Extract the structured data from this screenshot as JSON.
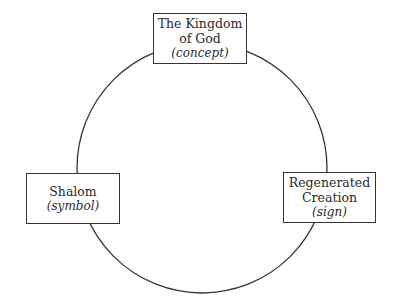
{
  "diagram": {
    "type": "cycle",
    "nodes": [
      {
        "id": "top",
        "title": "The Kingdom of God",
        "title_lines": [
          "The Kingdom",
          "of God"
        ],
        "qualifier": "(concept)"
      },
      {
        "id": "left",
        "title": "Shalom",
        "title_lines": [
          "Shalom"
        ],
        "qualifier": "(symbol)"
      },
      {
        "id": "right",
        "title": "Regenerated Creation",
        "title_lines": [
          "Regenerated",
          "Creation"
        ],
        "qualifier": "(sign)"
      }
    ]
  }
}
